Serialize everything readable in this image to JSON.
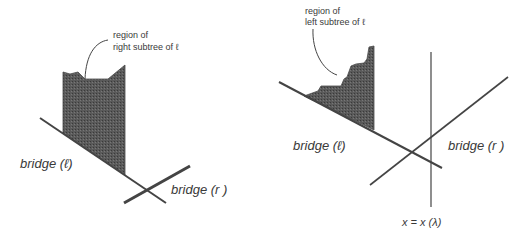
{
  "figure": {
    "colors": {
      "line": "#444444",
      "shade": "#555555",
      "text": "#3a3a3a",
      "background": "#ffffff"
    },
    "left_panel": {
      "annotation_line1": "region of",
      "annotation_line2": "right subtree of ℓ",
      "bridge_l_label": "bridge (ℓ)",
      "bridge_r_label": "bridge (r )"
    },
    "right_panel": {
      "annotation_line1": "region of",
      "annotation_line2": "left subtree of  ℓ",
      "bridge_l_label": "bridge (ℓ)",
      "bridge_r_label": "bridge (r )",
      "vertical_line_label": "x = x (λ)"
    }
  }
}
